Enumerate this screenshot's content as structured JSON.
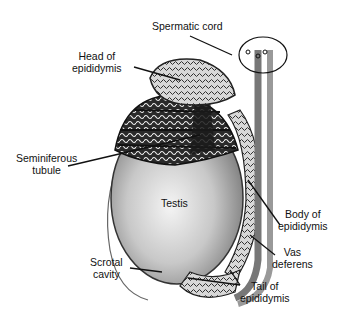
{
  "diagram": {
    "labels": {
      "spermatic_cord": [
        "Spermatic cord"
      ],
      "head_of_epididymis": [
        "Head of",
        "epididymis"
      ],
      "seminiferous_tubule": [
        "Seminiferous",
        "tubule"
      ],
      "testis": [
        "Testis"
      ],
      "body_of_epididymis": [
        "Body of",
        "epididymis"
      ],
      "vas_deferens": [
        "Vas",
        "deferens"
      ],
      "scrotal_cavity": [
        "Scrotal",
        "cavity"
      ],
      "tail_of_epididymis": [
        "Tail of",
        "epididymis"
      ]
    },
    "colors": {
      "ink": "#111111",
      "testis_fill_light": "#f2f2f2",
      "testis_fill_dark": "#8a8a8a",
      "tubule_fill": "#2a2a2a",
      "cord_fill": "#9a9a9a"
    }
  }
}
